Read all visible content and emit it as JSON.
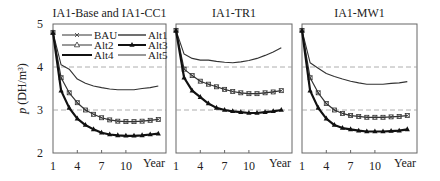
{
  "chart_data": {
    "type": "line",
    "ylabel": "p (DH/m³)",
    "ylabel_symbol": "p",
    "ylabel_unit": "(DH/m³)",
    "ylim": [
      2,
      5
    ],
    "yticks": [
      2,
      3,
      4,
      5
    ],
    "xlabel": "Year",
    "xticks": [
      1,
      4,
      7,
      10
    ],
    "x": [
      1,
      2,
      3,
      4,
      5,
      6,
      7,
      8,
      9,
      10,
      11,
      12,
      13,
      14
    ],
    "reference_lines": [
      3,
      4
    ],
    "legend": {
      "position": "inside top of first panel",
      "entries": [
        {
          "name": "BAU",
          "style": "line with x marker"
        },
        {
          "name": "Alt1",
          "style": "medium solid line"
        },
        {
          "name": "Alt2",
          "style": "line with open triangle marker"
        },
        {
          "name": "Alt3",
          "style": "thick line with filled triangle marker"
        },
        {
          "name": "Alt4",
          "style": "thick solid line"
        },
        {
          "name": "Alt5",
          "style": "thin solid line"
        }
      ]
    },
    "panels": [
      {
        "title": "IA1-Base and IA1-CC1",
        "series": [
          {
            "name": "Alt1/Alt4/Alt5 (upper)",
            "values": [
              4.8,
              4.05,
              3.95,
              3.72,
              3.62,
              3.56,
              3.52,
              3.49,
              3.47,
              3.47,
              3.47,
              3.5,
              3.52,
              3.56
            ]
          },
          {
            "name": "BAU/Alt2",
            "values": [
              4.8,
              3.75,
              3.4,
              3.17,
              3.0,
              2.9,
              2.82,
              2.77,
              2.74,
              2.73,
              2.73,
              2.74,
              2.76,
              2.78
            ]
          },
          {
            "name": "Alt3",
            "values": [
              4.8,
              3.45,
              3.05,
              2.8,
              2.65,
              2.55,
              2.47,
              2.43,
              2.41,
              2.4,
              2.4,
              2.41,
              2.43,
              2.45
            ]
          }
        ]
      },
      {
        "title": "IA1-TR1",
        "series": [
          {
            "name": "Alt1/Alt4/Alt5 (upper)",
            "values": [
              4.85,
              4.3,
              4.2,
              4.16,
              4.16,
              4.13,
              4.11,
              4.1,
              4.12,
              4.15,
              4.2,
              4.27,
              4.35,
              4.45
            ]
          },
          {
            "name": "BAU/Alt2",
            "values": [
              4.85,
              3.95,
              3.8,
              3.67,
              3.6,
              3.54,
              3.48,
              3.43,
              3.4,
              3.38,
              3.38,
              3.4,
              3.42,
              3.45
            ]
          },
          {
            "name": "Alt3",
            "values": [
              4.85,
              3.75,
              3.45,
              3.3,
              3.15,
              3.05,
              3.0,
              2.97,
              2.95,
              2.93,
              2.93,
              2.95,
              2.97,
              3.0
            ]
          }
        ]
      },
      {
        "title": "IA1-MW1",
        "series": [
          {
            "name": "Alt1/Alt4/Alt5 (upper)",
            "values": [
              4.85,
              4.1,
              3.97,
              3.85,
              3.78,
              3.72,
              3.67,
              3.63,
              3.6,
              3.6,
              3.6,
              3.62,
              3.63,
              3.66
            ]
          },
          {
            "name": "BAU/Alt2",
            "values": [
              4.85,
              3.75,
              3.4,
              3.15,
              3.0,
              2.92,
              2.87,
              2.85,
              2.83,
              2.83,
              2.83,
              2.84,
              2.85,
              2.87
            ]
          },
          {
            "name": "Alt3",
            "values": [
              4.85,
              3.45,
              3.05,
              2.8,
              2.65,
              2.58,
              2.55,
              2.52,
              2.5,
              2.5,
              2.5,
              2.51,
              2.52,
              2.55
            ]
          }
        ]
      }
    ]
  }
}
